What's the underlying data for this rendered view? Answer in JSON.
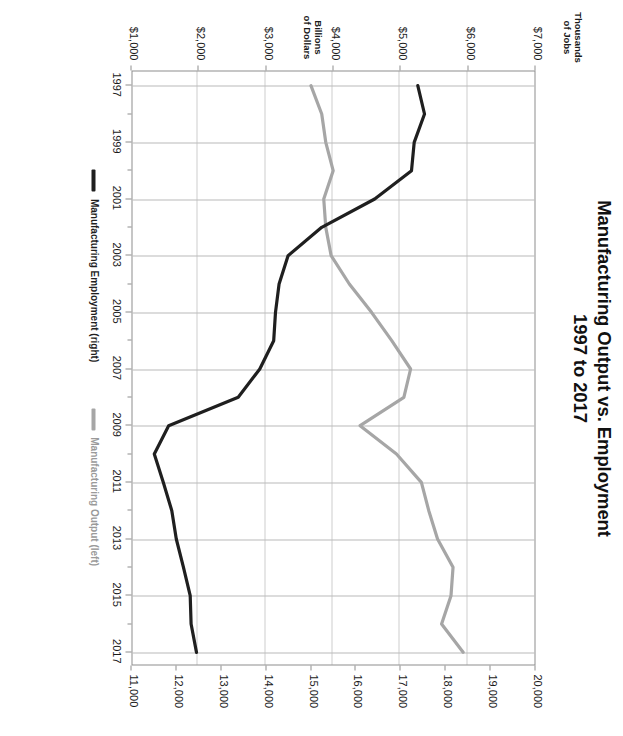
{
  "chart_data": {
    "type": "line",
    "title": "Manufacturing Output vs. Employment",
    "subtitle": "1997 to 2017",
    "title_lines": [
      "Manufacturing Output vs. Employment",
      "1997 to 2017"
    ],
    "xlabel": "",
    "x": [
      1997,
      1998,
      1999,
      2000,
      2001,
      2002,
      2003,
      2004,
      2005,
      2006,
      2007,
      2008,
      2009,
      2010,
      2011,
      2012,
      2013,
      2014,
      2015,
      2016,
      2017
    ],
    "x_tick_labels": [
      "1997",
      "1999",
      "2001",
      "2003",
      "2005",
      "2007",
      "2009",
      "2011",
      "2013",
      "2015",
      "2017"
    ],
    "xlim": [
      1996.5,
      2017.5
    ],
    "grid": true,
    "legend_position": "bottom",
    "axes": [
      {
        "id": "left",
        "label_lines": [
          "Billions",
          "of Dollars"
        ],
        "tick_labels": [
          "$7,000",
          "$6,000",
          "$5,000",
          "$4,000",
          "$3,000",
          "$2,000",
          "$1,000"
        ],
        "ticks": [
          7000,
          6000,
          5000,
          4000,
          3000,
          2000,
          1000
        ],
        "lim": [
          1000,
          7000
        ],
        "unit": "Billions of Dollars"
      },
      {
        "id": "right",
        "label_lines": [
          "Thousands",
          "of Jobs"
        ],
        "tick_labels": [
          "20,000",
          "19,000",
          "18,000",
          "17,000",
          "16,000",
          "15,000",
          "14,000",
          "13,000",
          "12,000",
          "11,000"
        ],
        "ticks": [
          20000,
          19000,
          18000,
          17000,
          16000,
          15000,
          14000,
          13000,
          12000,
          11000
        ],
        "lim": [
          11000,
          20000
        ],
        "unit": "Thousands of Jobs"
      }
    ],
    "series": [
      {
        "name": "Manufacturing Output (left)",
        "axis": "left",
        "color": "#a6a6a6",
        "values": [
          3680,
          3840,
          3900,
          4010,
          3870,
          3900,
          3980,
          4250,
          4580,
          4880,
          5160,
          5060,
          4410,
          4950,
          5320,
          5430,
          5560,
          5790,
          5760,
          5620,
          5940
        ]
      },
      {
        "name": "Manufacturing Employment (right)",
        "axis": "right",
        "color": "#1f1f1f",
        "values": [
          17400,
          17550,
          17320,
          17260,
          16440,
          15260,
          14510,
          14310,
          14230,
          14190,
          13880,
          13400,
          11850,
          11530,
          11730,
          11920,
          12020,
          12180,
          12330,
          12350,
          12470
        ]
      }
    ]
  }
}
